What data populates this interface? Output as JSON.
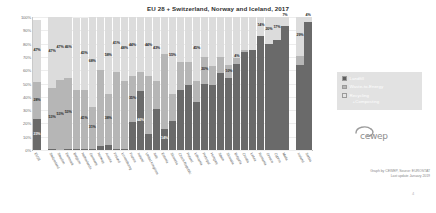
{
  "chart": {
    "title": "EU 28 + Switzerland, Norway and Iceland, 2017",
    "credit_line_1": "Graph by CEWEP, Source: EUROSTAT",
    "credit_line_2": "Last update January 2019",
    "logo_text": "cewep",
    "page_mark": "4"
  },
  "legend": {
    "position": "right",
    "items": [
      {
        "label": "Landfill",
        "color": "#5e5e5e"
      },
      {
        "label": "Waste-to-Energy",
        "color": "#b6b6b6"
      },
      {
        "label": "Recycling",
        "label_second_line": "+Composting",
        "color": "#e4e4e4"
      }
    ]
  },
  "colors": {
    "landfill": "#6a6a6a",
    "waste_to_energy": "#b6b6b6",
    "recycling_composting": "#dcdcdc",
    "background": "#ffffff",
    "gridline": "#ededed",
    "axis": "#b9b9b9"
  },
  "chart_data": {
    "type": "bar",
    "subtype": "stacked-100-percent",
    "title": "EU 28 + Switzerland, Norway and Iceland, 2017",
    "xlabel": "",
    "ylabel": "",
    "ylim": [
      0,
      100
    ],
    "yticks": [
      "0%",
      "10%",
      "20%",
      "30%",
      "40%",
      "50%",
      "60%",
      "70%",
      "80%",
      "90%",
      "100%"
    ],
    "grid": true,
    "legend_position": "right",
    "categories": [
      "EU28",
      "Switzerland",
      "Sweden",
      "Denmark",
      "Belgium",
      "Netherlands",
      "Germany",
      "Norway",
      "Austria",
      "Finland",
      "Luxembourg",
      "France",
      "Ireland",
      "United Kingdom",
      "Italy",
      "Estonia",
      "Slovenia",
      "Czech Republic",
      "Poland",
      "Lithuania",
      "Portugal",
      "Hungary",
      "Spain",
      "Slovakia",
      "Bulgaria",
      "Croatia",
      "Latvia",
      "Romania",
      "Greece",
      "Cyprus",
      "Malta",
      "Iceland",
      "Serbia"
    ],
    "series": [
      {
        "name": "Recycling +Composting",
        "color": "#dcdcdc",
        "values": [
          47,
          53,
          47,
          46,
          54,
          54,
          68,
          40,
          58,
          41,
          48,
          44,
          41,
          44,
          48,
          28,
          58,
          34,
          34,
          48,
          30,
          37,
          30,
          36,
          31,
          25,
          25,
          14,
          20,
          17,
          7,
          29,
          4
        ]
      },
      {
        "name": "Waste-to-Energy",
        "color": "#b6b6b6",
        "values": [
          28,
          46,
          53,
          53,
          44,
          44,
          31,
          57,
          38,
          58,
          51,
          35,
          15,
          44,
          21,
          56,
          20,
          21,
          17,
          16,
          20,
          14,
          12,
          10,
          4,
          1,
          0,
          0,
          0,
          0,
          0,
          7,
          0
        ]
      },
      {
        "name": "Landfill",
        "color": "#6a6a6a",
        "values": [
          23,
          1,
          0,
          1,
          1,
          1,
          1,
          3,
          4,
          1,
          1,
          21,
          44,
          12,
          31,
          16,
          22,
          45,
          49,
          36,
          50,
          49,
          58,
          54,
          65,
          74,
          75,
          86,
          80,
          83,
          93,
          64,
          96
        ]
      }
    ],
    "bars": [
      {
        "category": "EU28",
        "highlight": true,
        "landfill": 23,
        "wte": 28,
        "recycling": 47,
        "labels": {
          "recycling": "47%",
          "wte": "28%",
          "landfill": "23%"
        }
      },
      {
        "category": "Switzerland",
        "landfill": 1,
        "wte": 46,
        "recycling": 53,
        "labels": {
          "recycling": "47%",
          "wte": "53%",
          "landfill": ""
        }
      },
      {
        "category": "Sweden",
        "landfill": 0,
        "wte": 53,
        "recycling": 47,
        "labels": {
          "recycling": "47%",
          "wte": "53%",
          "landfill": ""
        }
      },
      {
        "category": "Denmark",
        "landfill": 1,
        "wte": 53,
        "recycling": 46,
        "labels": {
          "recycling": "46%",
          "wte": "53%",
          "landfill": ""
        }
      },
      {
        "category": "Belgium",
        "landfill": 1,
        "wte": 44,
        "recycling": 54,
        "labels": {
          "recycling": "",
          "wte": "",
          "landfill": ""
        }
      },
      {
        "category": "Netherlands",
        "landfill": 1,
        "wte": 44,
        "recycling": 54,
        "labels": {
          "recycling": "43%",
          "wte": "41%",
          "landfill": ""
        }
      },
      {
        "category": "Germany",
        "landfill": 1,
        "wte": 31,
        "recycling": 68,
        "labels": {
          "recycling": "68%",
          "wte": "31%",
          "landfill": ""
        }
      },
      {
        "category": "Norway",
        "landfill": 3,
        "wte": 57,
        "recycling": 40,
        "labels": {
          "recycling": "",
          "wte": "",
          "landfill": ""
        }
      },
      {
        "category": "Austria",
        "landfill": 4,
        "wte": 38,
        "recycling": 58,
        "labels": {
          "recycling": "58%",
          "wte": "38%",
          "landfill": ""
        }
      },
      {
        "category": "Finland",
        "landfill": 1,
        "wte": 58,
        "recycling": 41,
        "labels": {
          "recycling": "41%",
          "wte": "",
          "landfill": ""
        }
      },
      {
        "category": "Luxembourg",
        "landfill": 1,
        "wte": 51,
        "recycling": 48,
        "labels": {
          "recycling": "48%",
          "wte": "",
          "landfill": ""
        }
      },
      {
        "category": "France",
        "landfill": 21,
        "wte": 35,
        "recycling": 44,
        "labels": {
          "recycling": "44%",
          "wte": "35%",
          "landfill": ""
        }
      },
      {
        "category": "Ireland",
        "landfill": 44,
        "wte": 15,
        "recycling": 41,
        "labels": {
          "recycling": "",
          "wte": "",
          "landfill": "44%"
        }
      },
      {
        "category": "United Kingdom",
        "landfill": 12,
        "wte": 44,
        "recycling": 44,
        "labels": {
          "recycling": "44%",
          "wte": "",
          "landfill": ""
        }
      },
      {
        "category": "Italy",
        "landfill": 31,
        "wte": 21,
        "recycling": 48,
        "labels": {
          "recycling": "43%",
          "wte": "",
          "landfill": ""
        }
      },
      {
        "category": "Estonia",
        "landfill": 16,
        "wte": 56,
        "recycling": 28,
        "labels": {
          "recycling": "",
          "wte": "",
          "landfill": "14%"
        }
      },
      {
        "category": "Slovenia",
        "landfill": 22,
        "wte": 20,
        "recycling": 58,
        "labels": {
          "recycling": "55%",
          "wte": "",
          "landfill": ""
        }
      },
      {
        "category": "Czech Republic",
        "landfill": 45,
        "wte": 21,
        "recycling": 34,
        "labels": {
          "recycling": "",
          "wte": "",
          "landfill": ""
        }
      },
      {
        "category": "Poland",
        "landfill": 49,
        "wte": 17,
        "recycling": 34,
        "labels": {
          "recycling": "",
          "wte": "",
          "landfill": ""
        }
      },
      {
        "category": "Lithuania",
        "landfill": 36,
        "wte": 16,
        "recycling": 48,
        "labels": {
          "recycling": "45%",
          "wte": "",
          "landfill": ""
        }
      },
      {
        "category": "Portugal",
        "landfill": 50,
        "wte": 20,
        "recycling": 30,
        "labels": {
          "recycling": "",
          "wte": "20%",
          "landfill": ""
        }
      },
      {
        "category": "Hungary",
        "landfill": 49,
        "wte": 14,
        "recycling": 37,
        "labels": {
          "recycling": "",
          "wte": "",
          "landfill": ""
        }
      },
      {
        "category": "Spain",
        "landfill": 58,
        "wte": 12,
        "recycling": 30,
        "labels": {
          "recycling": "",
          "wte": "",
          "landfill": ""
        }
      },
      {
        "category": "Slovakia",
        "landfill": 54,
        "wte": 10,
        "recycling": 36,
        "labels": {
          "recycling": "",
          "wte": "10%",
          "landfill": ""
        }
      },
      {
        "category": "Bulgaria",
        "landfill": 65,
        "wte": 4,
        "recycling": 31,
        "labels": {
          "recycling": "",
          "wte": "4%",
          "landfill": ""
        }
      },
      {
        "category": "Croatia",
        "landfill": 74,
        "wte": 1,
        "recycling": 25,
        "labels": {
          "recycling": "",
          "wte": "",
          "landfill": ""
        }
      },
      {
        "category": "Latvia",
        "landfill": 75,
        "wte": 0,
        "recycling": 25,
        "labels": {
          "recycling": "",
          "wte": "",
          "landfill": ""
        }
      },
      {
        "category": "Romania",
        "landfill": 86,
        "wte": 0,
        "recycling": 14,
        "labels": {
          "recycling": "14%",
          "wte": "",
          "landfill": ""
        }
      },
      {
        "category": "Greece",
        "landfill": 80,
        "wte": 0,
        "recycling": 20,
        "labels": {
          "recycling": "20%",
          "wte": "",
          "landfill": ""
        }
      },
      {
        "category": "Cyprus",
        "landfill": 83,
        "wte": 0,
        "recycling": 17,
        "labels": {
          "recycling": "17%",
          "wte": "",
          "landfill": ""
        }
      },
      {
        "category": "Malta",
        "landfill": 93,
        "wte": 0,
        "recycling": 7,
        "labels": {
          "recycling": "7%",
          "wte": "",
          "landfill": ""
        }
      },
      {
        "category": "Iceland",
        "landfill": 64,
        "wte": 7,
        "recycling": 29,
        "labels": {
          "recycling": "29%",
          "wte": "",
          "landfill": ""
        }
      },
      {
        "category": "Serbia",
        "landfill": 96,
        "wte": 0,
        "recycling": 4,
        "labels": {
          "recycling": "4%",
          "wte": "",
          "landfill": ""
        }
      }
    ],
    "separated_groups": [
      {
        "start": 0,
        "end": 0
      },
      {
        "start": 1,
        "end": 30
      },
      {
        "start": 31,
        "end": 32
      }
    ]
  }
}
